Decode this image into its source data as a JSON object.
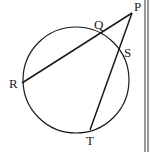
{
  "diagram": {
    "type": "circle-secants",
    "circle": {
      "cx": 76,
      "cy": 80,
      "r": 53
    },
    "points": {
      "P": {
        "x": 132,
        "y": 13
      },
      "Q": {
        "x": 100,
        "y": 33
      },
      "R": {
        "x": 22,
        "y": 83
      },
      "S": {
        "x": 119,
        "y": 49
      },
      "T": {
        "x": 90,
        "y": 130
      }
    },
    "segments": [
      {
        "from": "P",
        "to": "R"
      },
      {
        "from": "P",
        "to": "T"
      }
    ],
    "labels": {
      "P": {
        "text": "P",
        "x": 134,
        "y": 11
      },
      "Q": {
        "text": "Q",
        "x": 94,
        "y": 29
      },
      "R": {
        "text": "R",
        "x": 9,
        "y": 88
      },
      "S": {
        "text": "S",
        "x": 124,
        "y": 57
      },
      "T": {
        "text": "T",
        "x": 86,
        "y": 145
      }
    },
    "stroke_color": "#1a1a1a",
    "border_color": "#333333"
  }
}
